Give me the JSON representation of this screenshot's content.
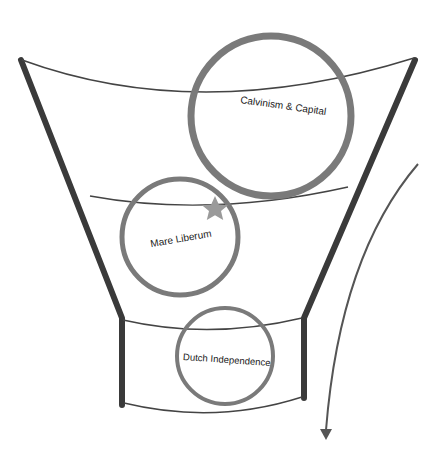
{
  "diagram": {
    "type": "funnel",
    "colors": {
      "funnel_walls": "#3a3a3a",
      "rims": "#444444",
      "circles": "#7a7a7a",
      "star": "#9a9a9a",
      "arrow": "#555555",
      "text": "#1a1a1a"
    },
    "circles": [
      {
        "label": "Calvinism & Capital"
      },
      {
        "label": "Mare Liberum"
      },
      {
        "label": "Dutch Independence"
      }
    ],
    "marker": {
      "icon": "star-icon"
    },
    "flow_arrow": {
      "direction": "down"
    }
  }
}
